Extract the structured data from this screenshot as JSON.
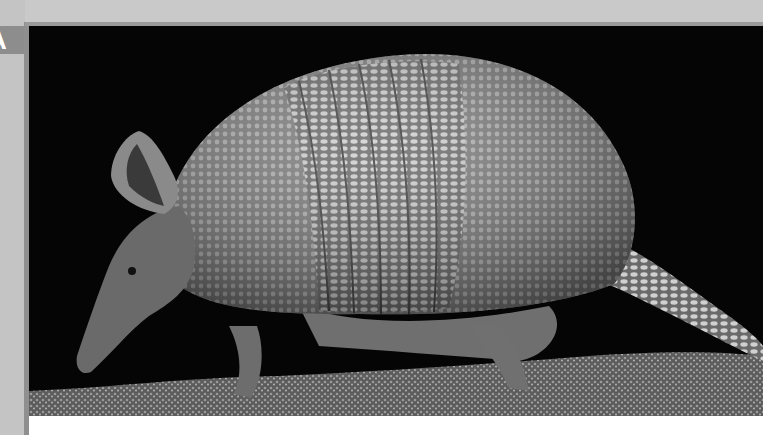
{
  "page": {
    "index_tab_letter": "A",
    "photo": {
      "subject": "armadillo",
      "description": "Black-and-white photograph of a nine-banded armadillo walking on a mossy log against a black background",
      "colors": {
        "background": "#050505",
        "shell": "#8a8a8a",
        "shell_highlight": "#c8c8c8",
        "ground": "#6e6e6e",
        "page_band": "#c9c9c9",
        "tab": "#8d8d8d"
      }
    }
  }
}
